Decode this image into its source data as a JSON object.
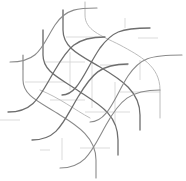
{
  "image": {
    "width": 186,
    "height": 181,
    "background": "#ffffff",
    "description": "Lattice of interwoven gray S-curves with faint straight guide lines"
  },
  "colors": {
    "dark_curve": "#6e6e6e",
    "mid_curve": "#8a8a8a",
    "light_curve": "#b4b4b4",
    "guide": "#d2d2d2"
  },
  "rising_curves": [
    {
      "d": "M 10 62 C 40 62, 42 45, 55 25 C 66 8, 80 8, 97 8",
      "tone": "mid"
    },
    {
      "d": "M 8 112 C 35 112, 40 95, 55 70 C 68 48, 75 37, 105 37",
      "tone": "dark"
    },
    {
      "d": "M 32 140 C 58 140, 63 122, 78 97 C 92 74, 100 64, 128 64",
      "tone": "dark"
    },
    {
      "d": "M 60 168 C 86 168, 92 150, 106 125 C 120 100, 130 90, 160 90",
      "tone": "mid"
    },
    {
      "d": "M 62 95 C 78 95, 85 70, 100 48 C 112 32, 120 28, 150 28",
      "tone": "dark"
    },
    {
      "d": "M 90 122 C 108 122, 115 96, 128 76 C 140 58, 150 55, 182 55",
      "tone": "mid"
    }
  ],
  "falling_curves": [
    {
      "d": "M 63 10 L 63 30 C 63 48, 80 55, 100 67 C 122 80, 140 92, 140 115 L 140 130",
      "tone": "dark"
    },
    {
      "d": "M 43 30 L 43 55 C 43 72, 60 78, 80 92 C 100 105, 118 115, 118 140 L 118 155",
      "tone": "dark"
    },
    {
      "d": "M 23 55 L 23 80 C 23 96, 40 102, 60 115 C 78 126, 96 138, 96 160 L 96 178",
      "tone": "mid"
    },
    {
      "d": "M 85 2 L 85 15 C 85 30, 100 35, 120 45 C 140 56, 160 66, 160 90 L 160 118",
      "tone": "light"
    },
    {
      "d": "M 40 90 C 60 98, 75 110, 90 118",
      "tone": "light"
    }
  ],
  "guides": [
    {
      "x1": 43,
      "y1": 30,
      "x2": 43,
      "y2": 45
    },
    {
      "x1": 63,
      "y1": 10,
      "x2": 63,
      "y2": 20
    },
    {
      "x1": 23,
      "y1": 55,
      "x2": 23,
      "y2": 70
    },
    {
      "x1": 66,
      "y1": 37,
      "x2": 100,
      "y2": 37
    },
    {
      "x1": 45,
      "y1": 62,
      "x2": 85,
      "y2": 62
    },
    {
      "x1": 25,
      "y1": 82,
      "x2": 65,
      "y2": 82
    },
    {
      "x1": 100,
      "y1": 65,
      "x2": 128,
      "y2": 65
    },
    {
      "x1": 70,
      "y1": 52,
      "x2": 70,
      "y2": 90
    },
    {
      "x1": 92,
      "y1": 60,
      "x2": 92,
      "y2": 108
    },
    {
      "x1": 115,
      "y1": 82,
      "x2": 115,
      "y2": 125
    },
    {
      "x1": 50,
      "y1": 100,
      "x2": 85,
      "y2": 100
    },
    {
      "x1": 85,
      "y1": 112,
      "x2": 130,
      "y2": 112
    },
    {
      "x1": 120,
      "y1": 92,
      "x2": 160,
      "y2": 92
    },
    {
      "x1": 0,
      "y1": 120,
      "x2": 20,
      "y2": 120
    },
    {
      "x1": 40,
      "y1": 150,
      "x2": 50,
      "y2": 150
    },
    {
      "x1": 62,
      "y1": 138,
      "x2": 62,
      "y2": 160
    },
    {
      "x1": 80,
      "y1": 148,
      "x2": 110,
      "y2": 148
    },
    {
      "x1": 125,
      "y1": 18,
      "x2": 125,
      "y2": 28
    },
    {
      "x1": 138,
      "y1": 38,
      "x2": 158,
      "y2": 38
    },
    {
      "x1": 140,
      "y1": 60,
      "x2": 140,
      "y2": 80
    }
  ]
}
